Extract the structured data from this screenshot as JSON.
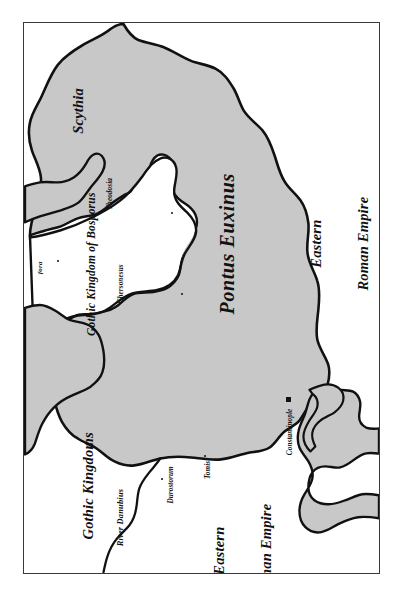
{
  "map": {
    "title": "Map of the Pontus Euxinus (Black Sea) region",
    "colors": {
      "sea_fill": "#c8c8c8",
      "land_fill": "#ffffff",
      "coastline": "#111111",
      "frame": "#3a3a3a",
      "text": "#111111"
    },
    "sea_label": "Pontus Euxinus",
    "regions": [
      {
        "name": "region-scythia",
        "label": "Scythia"
      },
      {
        "name": "region-gothic-kingdom-of-bosporus",
        "label": "Gothic Kingdom of Bosporus"
      },
      {
        "name": "region-gothic-kingdoms",
        "label": "Gothic Kingdoms"
      },
      {
        "name": "region-eastern-roman-empire-east",
        "label_line1": "Eastern",
        "label_line2": "Roman Empire"
      },
      {
        "name": "region-eastern-roman-empire-south",
        "label_line1": "Eastern",
        "label_line2": "Roman Empire"
      }
    ],
    "cities": [
      {
        "name": "city-theodosia",
        "label": "Theodosia"
      },
      {
        "name": "city-chersonesus",
        "label": "Chersonesus"
      },
      {
        "name": "city-fora",
        "label": "fora"
      },
      {
        "name": "city-durostorum",
        "label": "Durostorum"
      },
      {
        "name": "city-tomis",
        "label": "Tomis"
      },
      {
        "name": "city-constantinople",
        "label": "Constantinople",
        "is_capital": true
      }
    ],
    "rivers": [
      {
        "name": "river-danubius",
        "label": "River Danubius"
      }
    ]
  }
}
